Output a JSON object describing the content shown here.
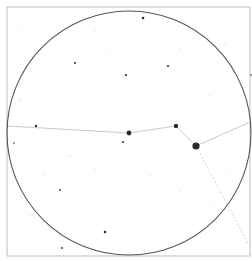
{
  "view": {
    "type": "sky-chart",
    "width": 252,
    "height": 261,
    "colors": {
      "background": "#ffffff",
      "frame": "#c8c8c8",
      "horizon": "#555555",
      "constellation_line": "#c9c9c9",
      "star": "#2a2a2a",
      "faint_star": "#d8d8d8"
    }
  },
  "frame": {
    "x": 7,
    "y": 7,
    "width": 243,
    "height": 249
  },
  "horizon_circle": {
    "cx": 129,
    "cy": 133,
    "r": 122
  },
  "constellation": {
    "stars": [
      {
        "x": 36,
        "y": 126,
        "r": 1.2
      },
      {
        "x": 129,
        "y": 133,
        "r": 2.4
      },
      {
        "x": 176,
        "y": 126,
        "r": 2.2
      },
      {
        "x": 196,
        "y": 146,
        "r": 3.6
      }
    ],
    "lines": [
      {
        "x1": 7,
        "y1": 126,
        "x2": 129,
        "y2": 133,
        "style": "solid"
      },
      {
        "x1": 129,
        "y1": 133,
        "x2": 176,
        "y2": 126,
        "style": "solid"
      },
      {
        "x1": 176,
        "y1": 126,
        "x2": 196,
        "y2": 146,
        "style": "solid"
      },
      {
        "x1": 196,
        "y1": 146,
        "x2": 250,
        "y2": 122,
        "style": "solid"
      },
      {
        "x1": 196,
        "y1": 146,
        "x2": 250,
        "y2": 247,
        "style": "dotted"
      }
    ]
  },
  "stars": [
    {
      "x": 143,
      "y": 18,
      "r": 1.3
    },
    {
      "x": 75,
      "y": 63,
      "r": 1.0
    },
    {
      "x": 126,
      "y": 75,
      "r": 1.1
    },
    {
      "x": 168,
      "y": 66,
      "r": 1.0
    },
    {
      "x": 123,
      "y": 142,
      "r": 1.0
    },
    {
      "x": 60,
      "y": 190,
      "r": 0.9
    },
    {
      "x": 105,
      "y": 232,
      "r": 1.3
    },
    {
      "x": 62,
      "y": 248,
      "r": 0.9
    },
    {
      "x": 251,
      "y": 75,
      "r": 0.8
    },
    {
      "x": 14,
      "y": 143,
      "r": 0.8
    }
  ],
  "faint_stars": [
    {
      "x": 22,
      "y": 27
    },
    {
      "x": 95,
      "y": 30
    },
    {
      "x": 40,
      "y": 60
    },
    {
      "x": 200,
      "y": 22
    },
    {
      "x": 180,
      "y": 50
    },
    {
      "x": 225,
      "y": 45
    },
    {
      "x": 88,
      "y": 97
    },
    {
      "x": 160,
      "y": 88
    },
    {
      "x": 210,
      "y": 95
    },
    {
      "x": 70,
      "y": 156
    },
    {
      "x": 45,
      "y": 175
    },
    {
      "x": 95,
      "y": 170
    },
    {
      "x": 150,
      "y": 175
    },
    {
      "x": 180,
      "y": 190
    },
    {
      "x": 210,
      "y": 205
    },
    {
      "x": 30,
      "y": 215
    },
    {
      "x": 125,
      "y": 200
    },
    {
      "x": 160,
      "y": 215
    },
    {
      "x": 85,
      "y": 245
    },
    {
      "x": 140,
      "y": 240
    },
    {
      "x": 230,
      "y": 170
    },
    {
      "x": 20,
      "y": 100
    },
    {
      "x": 240,
      "y": 140
    },
    {
      "x": 110,
      "y": 50
    }
  ]
}
